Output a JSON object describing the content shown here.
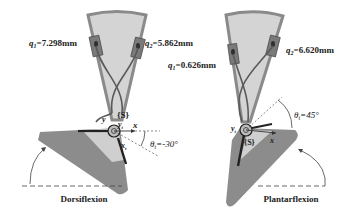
{
  "left_panel": {
    "caption": "Dorsiflexion",
    "q1_label": "q",
    "q1_sub": "1",
    "q1_value": "=7.298mm",
    "q2_label": "q",
    "q2_sub": "2",
    "q2_value": "=5.862mm",
    "frame_label": "{S}",
    "x_axis": "x",
    "y_axis": "y",
    "yt_axis": "y",
    "yt_sub": "t",
    "xt_axis": "x",
    "xt_sub": "t",
    "theta_label": "θ",
    "theta_sub": "t",
    "theta_value": "=-30°"
  },
  "right_panel": {
    "caption": "Plantarflexion",
    "q1_label": "q",
    "q1_sub": "1",
    "q1_value": "=0.626mm",
    "q2_label": "q",
    "q2_sub": "2",
    "q2_value": "=6.620mm",
    "frame_label": "{S}",
    "x_axis": "x",
    "yt_axis": "y",
    "yt_sub": "t",
    "theta_label": "θ",
    "theta_sub": "t",
    "theta_value": "=45°"
  },
  "colors": {
    "shank_fill": "#d4d4d4",
    "shank_border": "#8a8a8a",
    "foot_fill": "#8c8c8c",
    "foot_inner": "#cfcfcf",
    "cable": "#5a5a5a",
    "actuator": "#6e6e6e"
  }
}
